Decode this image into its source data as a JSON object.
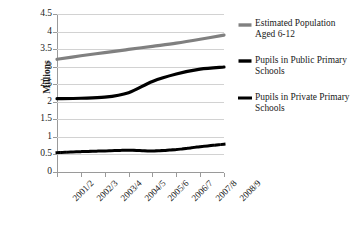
{
  "chart_data": {
    "type": "line",
    "title": "",
    "xlabel": "",
    "ylabel": "Millions",
    "ylim": [
      0,
      4.5
    ],
    "ytick_step": 0.5,
    "grid": true,
    "legend_position": "right",
    "categories": [
      "2001/2",
      "2002/3",
      "2003/4",
      "2004/5",
      "2005/6",
      "2006/7",
      "2007/8",
      "2008/9"
    ],
    "ytick_labels": [
      "0",
      "0.5",
      "1",
      "1.5",
      "2",
      "2.5",
      "3",
      "3.5",
      "4",
      "4.5"
    ],
    "series": [
      {
        "name": "Estimated Population Aged 6-12",
        "style": "solid",
        "color": "#808080",
        "width": 3.2,
        "values": [
          3.21,
          3.31,
          3.4,
          3.49,
          3.58,
          3.67,
          3.78,
          3.9
        ]
      },
      {
        "name": "Pupils in Public Primary Schools",
        "style": "solid",
        "color": "#000000",
        "width": 3.2,
        "values": [
          2.09,
          2.1,
          2.13,
          2.26,
          2.58,
          2.79,
          2.93,
          2.99
        ]
      },
      {
        "name": "Pupils in Private Primary Schools",
        "style": "dotted",
        "color": "#000000",
        "width": 3.0,
        "values": [
          0.55,
          0.58,
          0.6,
          0.62,
          0.6,
          0.64,
          0.72,
          0.79
        ]
      }
    ]
  },
  "legend": {
    "entries": [
      {
        "label": "Estimated Population Aged 6-12",
        "swatch": "gray-solid-line-icon"
      },
      {
        "label": "Pupils in Public Primary Schools",
        "swatch": "black-solid-line-icon"
      },
      {
        "label": "Pupils in Private Primary Schools",
        "swatch": "black-dotted-line-icon"
      }
    ]
  },
  "colors": {
    "population_series": "#808080",
    "public_series": "#000000",
    "private_series": "#000000",
    "gridline": "#d2d2d2",
    "axis": "#9a9a9a",
    "background": "#ffffff"
  }
}
